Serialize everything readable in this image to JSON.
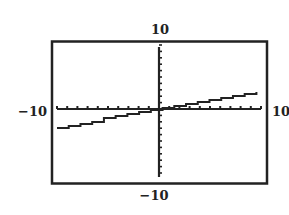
{
  "chart_data": {
    "type": "line",
    "title": "",
    "xlabel": "",
    "ylabel": "",
    "xlim": [
      -10,
      10
    ],
    "ylim": [
      -10,
      10
    ],
    "x_scale": 1,
    "y_scale": 1,
    "grid": false,
    "window_labels": {
      "ymax": "10",
      "ymin": "−10",
      "xmin": "−10",
      "xmax": "10"
    },
    "series": [
      {
        "name": "graph",
        "style": "stepped-pixel",
        "x": [
          -10,
          -5,
          0,
          5,
          10
        ],
        "y": [
          -2.85,
          -1.45,
          0,
          1.4,
          2.75
        ]
      }
    ]
  },
  "colors": {
    "ink": "#222222",
    "background": "#ffffff"
  }
}
